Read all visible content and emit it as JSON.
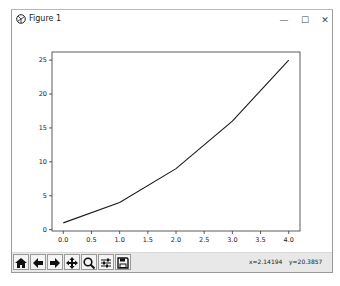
{
  "window": {
    "title": "Figure 1",
    "minimize_glyph": "—",
    "maximize_glyph": "☐",
    "close_glyph": "✕"
  },
  "toolbar": {
    "buttons": [
      {
        "name": "home",
        "icon": "home-icon"
      },
      {
        "name": "back",
        "icon": "arrow-left-icon"
      },
      {
        "name": "forward",
        "icon": "arrow-right-icon"
      },
      {
        "name": "pan",
        "icon": "move-icon"
      },
      {
        "name": "zoom",
        "icon": "magnifier-icon"
      },
      {
        "name": "configure-subplots",
        "icon": "sliders-icon"
      },
      {
        "name": "save",
        "icon": "floppy-disk-icon"
      }
    ],
    "x_coord": "x=2.14194",
    "y_coord": "y=20.3857"
  },
  "chart_data": {
    "type": "line",
    "title": "",
    "xlabel": "",
    "ylabel": "",
    "x": [
      0,
      1,
      2,
      3,
      4
    ],
    "series": [
      {
        "name": "line",
        "values": [
          1,
          4,
          9,
          16,
          25
        ],
        "color": "#1a1a1a"
      }
    ],
    "xlim": [
      -0.2,
      4.2
    ],
    "ylim": [
      -0.2,
      26.2
    ],
    "xticks": [
      "0.0",
      "0.5",
      "1.0",
      "1.5",
      "2.0",
      "2.5",
      "3.0",
      "3.5",
      "4.0"
    ],
    "yticks": [
      "0",
      "5",
      "10",
      "15",
      "20",
      "25"
    ],
    "grid": false,
    "legend": null
  }
}
